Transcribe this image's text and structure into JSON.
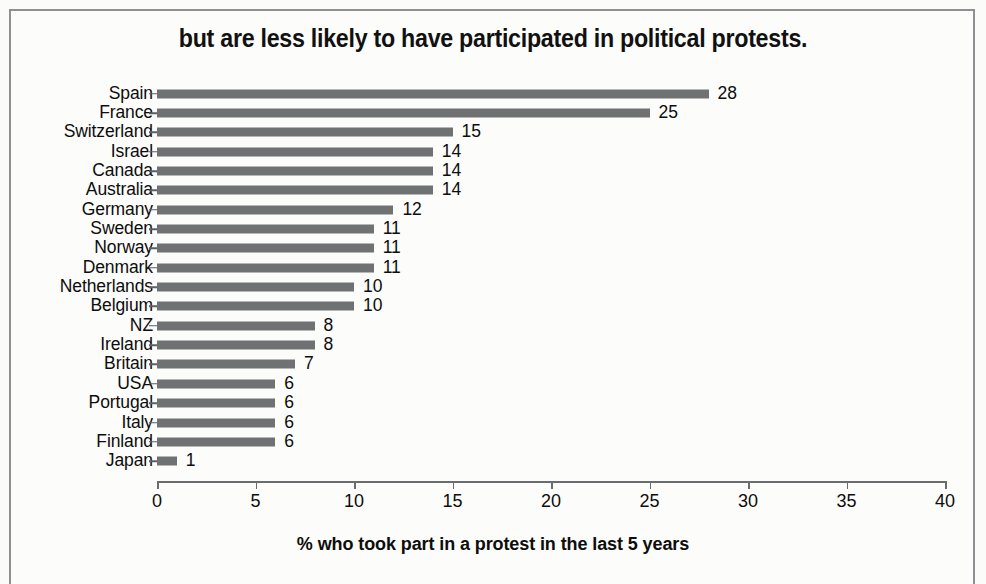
{
  "chart_data": {
    "type": "bar",
    "orientation": "horizontal",
    "title": "but are less likely to have participated in political protests.",
    "xlabel": "% who took part in a protest in the last 5 years",
    "ylabel": "",
    "xlim": [
      0,
      40
    ],
    "xticks": [
      0,
      5,
      10,
      15,
      20,
      25,
      30,
      35,
      40
    ],
    "grid": false,
    "legend": null,
    "bar_color": "#6f7173",
    "categories": [
      "Spain",
      "France",
      "Switzerland",
      "Israel",
      "Canada",
      "Australia",
      "Germany",
      "Sweden",
      "Norway",
      "Denmark",
      "Netherlands",
      "Belgium",
      "NZ",
      "Ireland",
      "Britain",
      "USA",
      "Portugal",
      "Italy",
      "Finland",
      "Japan"
    ],
    "values": [
      28,
      25,
      15,
      14,
      14,
      14,
      12,
      11,
      11,
      11,
      10,
      10,
      8,
      8,
      7,
      6,
      6,
      6,
      6,
      1
    ],
    "value_labels": [
      "28",
      "25",
      "15",
      "14",
      "14",
      "14",
      "12",
      "11",
      "11",
      "11",
      "10",
      "10",
      "8",
      "8",
      "7",
      "6",
      "6",
      "6",
      "6",
      "1"
    ]
  }
}
